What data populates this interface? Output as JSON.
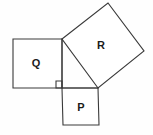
{
  "figure": {
    "background_color": "#fefefe",
    "stroke_color": "#3a3a3a",
    "fill_color": "#ffffff",
    "label_color": "#1b1b1b",
    "canvas": {
      "width": 153,
      "height": 135
    }
  },
  "shapes": {
    "square_q": {
      "label": "Q",
      "points": "13,39 62,39 62,88 13,88",
      "label_x": 36,
      "label_y": 63
    },
    "square_p": {
      "label": "P",
      "points": "62,88 98,88 99,125 63,125",
      "label_x": 81,
      "label_y": 107
    },
    "square_r": {
      "label": "R",
      "points": "62,39 108,3 144,51 98,88",
      "label_x": 101,
      "label_y": 45
    }
  },
  "right_angle_marker": {
    "name": "right-angle-mark",
    "points": "56,81 62,81 62,88 56,88"
  },
  "triangle": {
    "name": "central-right-triangle",
    "points": "62,39 62,88 98,88"
  }
}
